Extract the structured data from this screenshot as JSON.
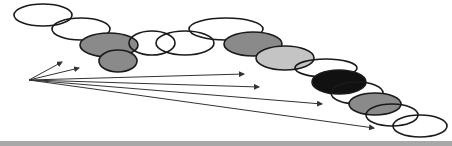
{
  "diagram": {
    "type": "overlapping-ellipse-chain-with-radiating-arrows",
    "colors": {
      "stroke": "#1a1a1a",
      "outline_fill": "none",
      "gray_fill": "#8a8a8a",
      "light_gray_fill": "#c4c4c4",
      "black_fill": "#111111",
      "arrow": "#333333",
      "bottom_bar": "#a8a8a8"
    },
    "ellipses": [
      {
        "id": "e1",
        "cx": 43,
        "cy": 15,
        "rx": 29,
        "ry": 11,
        "fill": "none"
      },
      {
        "id": "e2",
        "cx": 81,
        "cy": 29,
        "rx": 29,
        "ry": 11,
        "fill": "none"
      },
      {
        "id": "e3",
        "cx": 109,
        "cy": 45,
        "rx": 29,
        "ry": 12,
        "fill": "gray"
      },
      {
        "id": "e4",
        "cx": 118,
        "cy": 61,
        "rx": 19,
        "ry": 11,
        "fill": "gray"
      },
      {
        "id": "e5",
        "cx": 152,
        "cy": 43,
        "rx": 23,
        "ry": 12,
        "fill": "none"
      },
      {
        "id": "e6",
        "cx": 185,
        "cy": 43,
        "rx": 29,
        "ry": 12,
        "fill": "none"
      },
      {
        "id": "e7",
        "cx": 226,
        "cy": 29,
        "rx": 37,
        "ry": 11,
        "fill": "none"
      },
      {
        "id": "e8",
        "cx": 253,
        "cy": 44,
        "rx": 29,
        "ry": 12,
        "fill": "gray"
      },
      {
        "id": "e9",
        "cx": 285,
        "cy": 58,
        "rx": 29,
        "ry": 12,
        "fill": "light_gray"
      },
      {
        "id": "e10",
        "cx": 326,
        "cy": 68,
        "rx": 31,
        "ry": 9,
        "fill": "none"
      },
      {
        "id": "e11",
        "cx": 339,
        "cy": 82,
        "rx": 27,
        "ry": 12,
        "fill": "black"
      },
      {
        "id": "e12",
        "cx": 357,
        "cy": 93,
        "rx": 26,
        "ry": 11,
        "fill": "none"
      },
      {
        "id": "e13",
        "cx": 375,
        "cy": 104,
        "rx": 26,
        "ry": 11,
        "fill": "gray"
      },
      {
        "id": "e14",
        "cx": 392,
        "cy": 115,
        "rx": 26,
        "ry": 11,
        "fill": "none"
      },
      {
        "id": "e15",
        "cx": 420,
        "cy": 126,
        "rx": 27,
        "ry": 11,
        "fill": "none"
      }
    ],
    "arrow_origin": {
      "x": 29,
      "y": 80
    },
    "arrows": [
      {
        "id": "a1",
        "x2": 62,
        "y2": 62
      },
      {
        "id": "a2",
        "x2": 79,
        "y2": 68
      },
      {
        "id": "a3",
        "x2": 244,
        "y2": 74
      },
      {
        "id": "a4",
        "x2": 259,
        "y2": 87
      },
      {
        "id": "a5",
        "x2": 322,
        "y2": 104
      },
      {
        "id": "a6",
        "x2": 374,
        "y2": 128
      }
    ]
  }
}
